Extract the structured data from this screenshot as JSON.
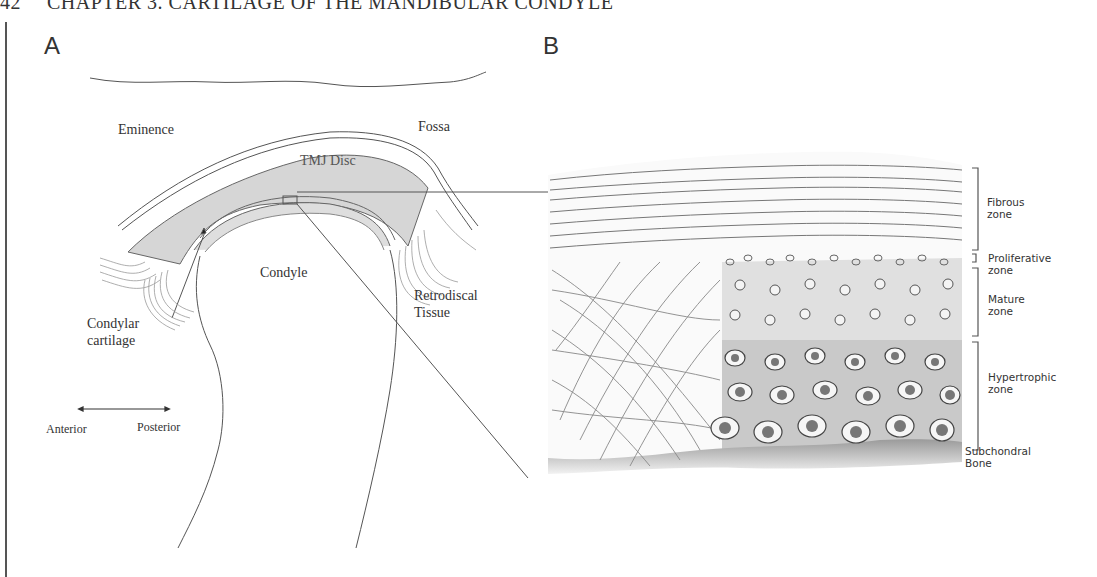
{
  "running_head": {
    "page_number": "42",
    "chapter_title": "CHAPTER 3. CARTILAGE OF THE MANDIBULAR CONDYLE"
  },
  "figure": {
    "panel_a": {
      "label": "A",
      "labels": {
        "eminence": "Eminence",
        "fossa": "Fossa",
        "tmj_disc": "TMJ Disc",
        "condyle": "Condyle",
        "retrodiscal_line1": "Retrodiscal",
        "retrodiscal_line2": "Tissue",
        "condylar_line1": "Condylar",
        "condylar_line2": "cartilage",
        "anterior": "Anterior",
        "posterior": "Posterior"
      }
    },
    "panel_b": {
      "label": "B",
      "zones": [
        {
          "line1": "Fibrous",
          "line2": "zone"
        },
        {
          "line1": "Proliferative",
          "line2": "zone"
        },
        {
          "line1": "Mature",
          "line2": "zone"
        },
        {
          "line1": "Hypertrophic",
          "line2": "zone"
        },
        {
          "line1": "Subchondral",
          "line2": "Bone"
        }
      ]
    }
  }
}
